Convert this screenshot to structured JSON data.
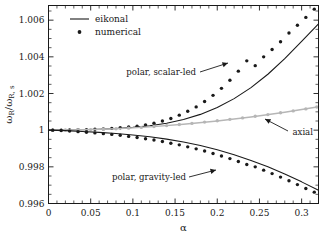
{
  "chart_data": {
    "type": "line",
    "title": "",
    "xlabel": "α",
    "ylabel": "ω_R / ω_R,s",
    "xlim": [
      0,
      0.32
    ],
    "ylim": [
      0.996,
      1.0068
    ],
    "grid": false,
    "xticks": [
      "0",
      "0.05",
      "0.1",
      "0.15",
      "0.2",
      "0.25",
      "0.3"
    ],
    "xtick_values": [
      0,
      0.05,
      0.1,
      0.15,
      0.2,
      0.25,
      0.3
    ],
    "yticks": [
      "1.006",
      "1.004",
      "1.002",
      "1",
      "0.998",
      "0.996"
    ],
    "ytick_values": [
      1.006,
      1.004,
      1.002,
      1.0,
      0.998,
      0.996
    ],
    "legend": {
      "position": "top-left",
      "entries": [
        {
          "label": "eikonal",
          "marker": "line",
          "color": "#1a1a1a"
        },
        {
          "label": "numerical",
          "marker": "dot",
          "color": "#1a1a1a"
        }
      ]
    },
    "annotations": [
      {
        "text": "polar, scalar-led",
        "x": 0.145,
        "y": 1.00355,
        "arrow": "right"
      },
      {
        "text": "axial",
        "x": 0.285,
        "y": 1.00048,
        "arrow": "up-left"
      },
      {
        "text": "polar, gravity-led",
        "x": 0.105,
        "y": 0.99765,
        "arrow": "right"
      }
    ],
    "series": [
      {
        "name": "polar, scalar-led (eikonal)",
        "style": "line",
        "color": "#1a1a1a",
        "x": [
          0,
          0.02,
          0.04,
          0.06,
          0.08,
          0.1,
          0.12,
          0.14,
          0.16,
          0.18,
          0.2,
          0.22,
          0.24,
          0.26,
          0.28,
          0.3,
          0.32
        ],
        "y": [
          1.0,
          1.000005,
          1.00002,
          1.00005,
          1.00009,
          1.00015,
          1.00024,
          1.00038,
          1.00058,
          1.00086,
          1.00124,
          1.00172,
          1.00232,
          1.00305,
          1.0039,
          1.00484,
          1.0058
        ]
      },
      {
        "name": "polar, scalar-led (numerical)",
        "style": "dots",
        "color": "#1a1a1a",
        "x": [
          0.005,
          0.015,
          0.025,
          0.035,
          0.045,
          0.055,
          0.065,
          0.075,
          0.085,
          0.095,
          0.105,
          0.115,
          0.125,
          0.135,
          0.145,
          0.155,
          0.165,
          0.175,
          0.185,
          0.195,
          0.205,
          0.215,
          0.225,
          0.235,
          0.245,
          0.255,
          0.265,
          0.275,
          0.285,
          0.295,
          0.305,
          0.315
        ],
        "y": [
          1.0,
          1.000004,
          1.00001,
          1.00002,
          1.00003,
          1.00005,
          1.00007,
          1.0001,
          1.00013,
          1.00017,
          1.00022,
          1.00029,
          1.00038,
          1.0005,
          1.00064,
          1.00082,
          1.00103,
          1.00127,
          1.00156,
          1.0019,
          1.00228,
          1.00272,
          1.00322,
          1.00378,
          1.00352,
          1.004,
          1.0044,
          1.00482,
          1.0053,
          1.00572,
          1.00615,
          1.0066
        ]
      },
      {
        "name": "axial (eikonal)",
        "style": "line",
        "color": "#b6b6b6",
        "x": [
          0,
          0.04,
          0.08,
          0.12,
          0.16,
          0.2,
          0.24,
          0.28,
          0.32
        ],
        "y": [
          1.0,
          1.00002,
          1.00008,
          1.00018,
          1.00032,
          1.0005,
          1.00072,
          1.00098,
          1.00128
        ]
      },
      {
        "name": "axial (numerical)",
        "style": "dots",
        "color": "#b6b6b6",
        "x": [
          0.005,
          0.02,
          0.035,
          0.05,
          0.065,
          0.08,
          0.095,
          0.11,
          0.125,
          0.14,
          0.155,
          0.17,
          0.185,
          0.2,
          0.215,
          0.23,
          0.245,
          0.26,
          0.275,
          0.29,
          0.305,
          0.318
        ],
        "y": [
          1.0,
          1.000006,
          1.00002,
          1.00003,
          1.00005,
          1.00008,
          1.00011,
          1.00015,
          1.0002,
          1.00025,
          1.00031,
          1.00037,
          1.00044,
          1.00051,
          1.00059,
          1.00067,
          1.00076,
          1.00085,
          1.00095,
          1.00105,
          1.00116,
          1.00126
        ]
      },
      {
        "name": "polar, gravity-led (eikonal)",
        "style": "line",
        "color": "#1a1a1a",
        "x": [
          0,
          0.02,
          0.04,
          0.06,
          0.08,
          0.1,
          0.12,
          0.14,
          0.16,
          0.18,
          0.2,
          0.22,
          0.24,
          0.26,
          0.28,
          0.3,
          0.32
        ],
        "y": [
          1.0,
          0.999975,
          0.99993,
          0.99988,
          0.99982,
          0.99974,
          0.99964,
          0.99951,
          0.99935,
          0.99916,
          0.99893,
          0.99866,
          0.99835,
          0.998,
          0.99761,
          0.99718,
          0.99672
        ]
      },
      {
        "name": "polar, gravity-led (numerical)",
        "style": "dots",
        "color": "#1a1a1a",
        "x": [
          0.005,
          0.015,
          0.025,
          0.035,
          0.045,
          0.055,
          0.065,
          0.075,
          0.085,
          0.095,
          0.105,
          0.115,
          0.125,
          0.135,
          0.145,
          0.155,
          0.165,
          0.175,
          0.185,
          0.195,
          0.205,
          0.215,
          0.225,
          0.235,
          0.245,
          0.255,
          0.265,
          0.275,
          0.285,
          0.295,
          0.305,
          0.315
        ],
        "y": [
          1.0,
          0.99998,
          0.99995,
          0.99992,
          0.99989,
          0.99985,
          0.99981,
          0.99977,
          0.99972,
          0.99966,
          0.9996,
          0.99953,
          0.99946,
          0.99938,
          0.99929,
          0.9992,
          0.99909,
          0.99898,
          0.99886,
          0.99873,
          0.99859,
          0.99845,
          0.99829,
          0.99813,
          0.998,
          0.99782,
          0.99763,
          0.99744,
          0.99724,
          0.99703,
          0.99682,
          0.99662
        ]
      }
    ]
  }
}
